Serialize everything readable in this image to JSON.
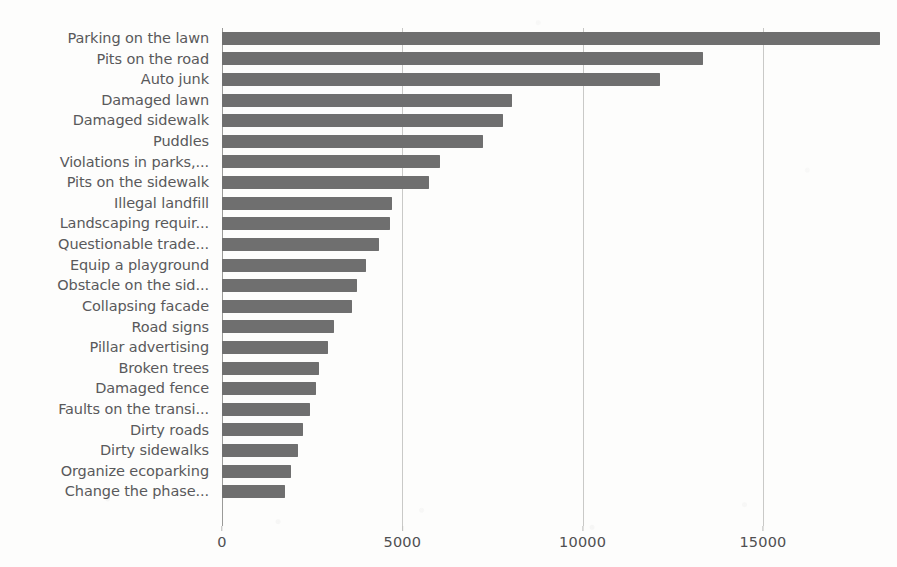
{
  "chart_data": {
    "type": "bar",
    "orientation": "horizontal",
    "title": "",
    "subtitle": "",
    "xlabel": "",
    "ylabel": "",
    "xlim": [
      0,
      18300
    ],
    "grid": true,
    "legend": null,
    "legend_position": "none",
    "bar_color": "#6f6f6f",
    "gridline_color": "#c9c9c7",
    "label_color": "#59595b",
    "tick_color": "#4f4f51",
    "xticks": [
      0,
      5000,
      10000,
      15000
    ],
    "xtick_labels": [
      "0",
      "5000",
      "10000",
      "15000"
    ],
    "categories": [
      "Parking on the lawn",
      "Pits on the road",
      "Auto junk",
      "Damaged lawn",
      "Damaged sidewalk",
      "Puddles",
      "Violations in parks,...",
      "Pits on the sidewalk",
      "Illegal landfill",
      "Landscaping requir...",
      "Questionable trade...",
      "Equip a playground",
      "Obstacle on the sid...",
      "Collapsing facade",
      "Road signs",
      "Pillar advertising",
      "Broken trees",
      "Damaged fence",
      "Faults on the transi...",
      "Dirty roads",
      "Dirty sidewalks",
      "Organize ecoparking",
      "Change the phase..."
    ],
    "values": [
      18250,
      13350,
      12150,
      8050,
      7800,
      7250,
      6050,
      5750,
      4700,
      4650,
      4350,
      4000,
      3750,
      3600,
      3100,
      2950,
      2700,
      2600,
      2450,
      2250,
      2100,
      1900,
      1750
    ]
  }
}
